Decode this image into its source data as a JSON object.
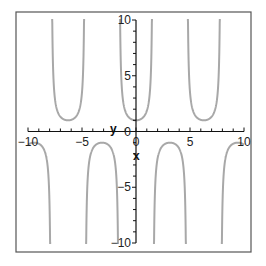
{
  "chart_data": {
    "type": "line",
    "title": "",
    "function": "sec(x)",
    "xlabel": "x",
    "ylabel": "y",
    "xlim": [
      -10,
      10
    ],
    "ylim": [
      -10,
      10
    ],
    "grid": false,
    "legend": "none",
    "x_ticks": [
      -10,
      -5,
      0,
      5,
      10
    ],
    "x_tick_labels": [
      "-10",
      "-5",
      "0",
      "5",
      "10"
    ],
    "y_ticks": [
      -10,
      -5,
      0,
      5,
      10
    ],
    "y_tick_labels": [
      "-10",
      "-5",
      "0",
      "5",
      "10"
    ],
    "vertical_asymptotes": [
      -7.854,
      -4.712,
      -1.571,
      1.571,
      4.712,
      7.854
    ],
    "series": [
      {
        "name": "sec(x)",
        "color": "#a8a8a8",
        "branches": [
          {
            "x_range": [
              -10,
              -7.854
            ],
            "direction": "down",
            "extremum": {
              "x": -9.425,
              "y": -1
            }
          },
          {
            "x_range": [
              -7.854,
              -4.712
            ],
            "direction": "up",
            "extremum": {
              "x": -6.283,
              "y": 1
            }
          },
          {
            "x_range": [
              -4.712,
              -1.571
            ],
            "direction": "down",
            "extremum": {
              "x": -3.142,
              "y": -1
            }
          },
          {
            "x_range": [
              -1.571,
              1.571
            ],
            "direction": "up",
            "extremum": {
              "x": 0,
              "y": 1
            }
          },
          {
            "x_range": [
              1.571,
              4.712
            ],
            "direction": "down",
            "extremum": {
              "x": 3.142,
              "y": -1
            }
          },
          {
            "x_range": [
              4.712,
              7.854
            ],
            "direction": "up",
            "extremum": {
              "x": 6.283,
              "y": 1
            }
          },
          {
            "x_range": [
              7.854,
              10
            ],
            "direction": "down",
            "extremum": {
              "x": 9.425,
              "y": -1
            }
          }
        ]
      }
    ]
  },
  "colors": {
    "curve": "#a8a8a8",
    "axis": "#111111",
    "frame": "#555555"
  }
}
